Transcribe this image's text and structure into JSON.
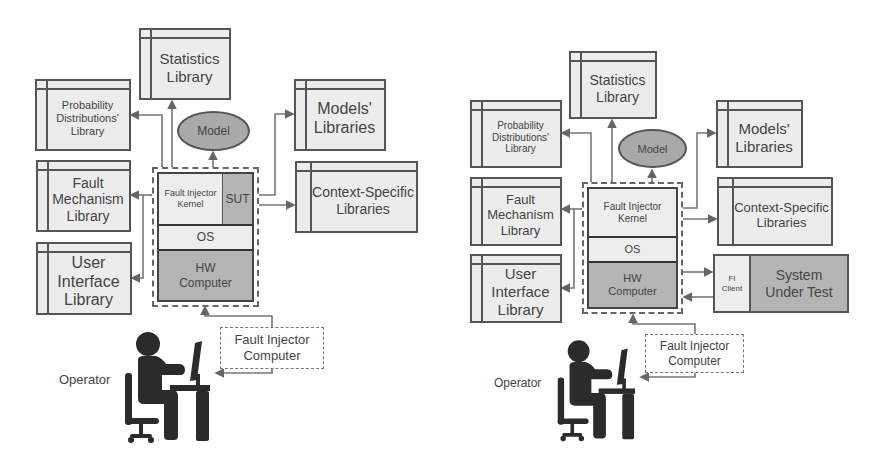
{
  "colors": {
    "library_fill": "#ececec",
    "dark_fill": "#b4b4b4",
    "model_fill": "#a9a9a9",
    "border": "#555555",
    "text": "#444444"
  },
  "left_diagram": {
    "statistics_library": "Statistics\nLibrary",
    "probability_library": "Probability\nDistributions'\nLibrary",
    "models_libraries": "Models'\nLibraries",
    "model": "Model",
    "fault_mechanism_library": "Fault\nMechanism\nLibrary",
    "context_specific_libraries": "Context-Specific\nLibraries",
    "user_interface_library": "User\nInterface\nLibrary",
    "fi_kernel": "Fault Injector\nKernel",
    "sut": "SUT",
    "os": "OS",
    "hw_computer": "HW\nComputer",
    "fault_injector_computer": "Fault Injector\nComputer",
    "operator": "Operator"
  },
  "right_diagram": {
    "statistics_library": "Statistics\nLibrary",
    "probability_library": "Probability\nDistributions'\nLibrary",
    "models_libraries": "Models'\nLibraries",
    "model": "Model",
    "fault_mechanism_library": "Fault\nMechanism\nLibrary",
    "context_specific_libraries": "Context-Specific\nLibraries",
    "user_interface_library": "User\nInterface\nLibrary",
    "fi_kernel": "Fault Injector\nKernel",
    "os": "OS",
    "hw_computer": "HW\nComputer",
    "fi_client": "FI\nClient",
    "system_under_test": "System\nUnder Test",
    "fault_injector_computer": "Fault Injector\nComputer",
    "operator": "Operator"
  }
}
